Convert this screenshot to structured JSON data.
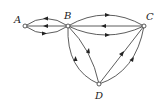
{
  "diagram": {
    "type": "directed-multigraph",
    "nodes": [
      {
        "id": "A",
        "label": "A",
        "x": 25,
        "y": 26,
        "lx": 14,
        "ly": 23
      },
      {
        "id": "B",
        "label": "B",
        "x": 68,
        "y": 26,
        "lx": 64,
        "ly": 19
      },
      {
        "id": "C",
        "label": "C",
        "x": 144,
        "y": 26,
        "lx": 146,
        "ly": 20
      },
      {
        "id": "D",
        "label": "D",
        "x": 99,
        "y": 84,
        "lx": 95,
        "ly": 99
      }
    ],
    "edges": [
      {
        "from": "B",
        "to": "A",
        "shape": "upper-arc"
      },
      {
        "from": "B",
        "to": "A",
        "shape": "straight"
      },
      {
        "from": "A",
        "to": "B",
        "shape": "lower-arc"
      },
      {
        "from": "B",
        "to": "C",
        "shape": "upper-arc"
      },
      {
        "from": "C",
        "to": "B",
        "shape": "straight"
      },
      {
        "from": "B",
        "to": "C",
        "shape": "lower-arc"
      },
      {
        "from": "D",
        "to": "B",
        "shape": "outer-arc"
      },
      {
        "from": "D",
        "to": "B",
        "shape": "inner-curve"
      },
      {
        "from": "D",
        "to": "C",
        "shape": "straight"
      },
      {
        "from": "D",
        "to": "C",
        "shape": "outer-arc"
      }
    ]
  }
}
